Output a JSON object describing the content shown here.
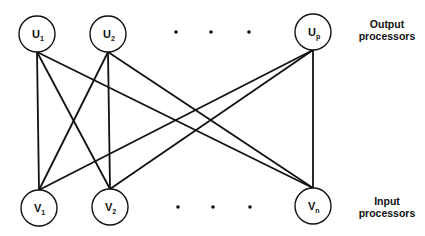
{
  "diagram": {
    "type": "bipartite-network",
    "colors": {
      "stroke": "#111111",
      "background": "#ffffff"
    },
    "output_layer": {
      "label_line1": "Output",
      "label_line2": "processors",
      "nodes": [
        {
          "id": "U1",
          "base": "U",
          "sub": "1",
          "cx": 37,
          "cy": 34
        },
        {
          "id": "U2",
          "base": "U",
          "sub": "2",
          "cx": 108,
          "cy": 34
        },
        {
          "id": "Up",
          "base": "U",
          "sub": "p",
          "cx": 313,
          "cy": 32
        }
      ],
      "ellipsis_dots": [
        {
          "x": 176,
          "y": 32
        },
        {
          "x": 211,
          "y": 32
        },
        {
          "x": 249,
          "y": 32
        }
      ]
    },
    "input_layer": {
      "label_line1": "Input",
      "label_line2": "processors",
      "nodes": [
        {
          "id": "V1",
          "base": "V",
          "sub": "1",
          "cx": 39,
          "cy": 208
        },
        {
          "id": "V2",
          "base": "V",
          "sub": "2",
          "cx": 110,
          "cy": 207
        },
        {
          "id": "Vn",
          "base": "V",
          "sub": "n",
          "cx": 313,
          "cy": 206
        }
      ],
      "ellipsis_dots": [
        {
          "x": 178,
          "y": 207
        },
        {
          "x": 213,
          "y": 207
        },
        {
          "x": 250,
          "y": 207
        }
      ]
    },
    "node_radius": 18,
    "edges": [
      {
        "from": "U1",
        "to": "V1"
      },
      {
        "from": "U1",
        "to": "V2"
      },
      {
        "from": "U1",
        "to": "Vn"
      },
      {
        "from": "U2",
        "to": "V1"
      },
      {
        "from": "U2",
        "to": "V2"
      },
      {
        "from": "U2",
        "to": "Vn"
      },
      {
        "from": "Up",
        "to": "V1"
      },
      {
        "from": "Up",
        "to": "V2"
      },
      {
        "from": "Up",
        "to": "Vn"
      }
    ]
  }
}
